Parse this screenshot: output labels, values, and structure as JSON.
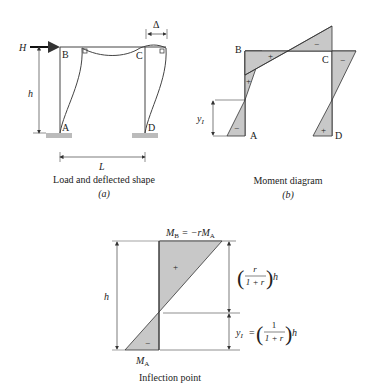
{
  "colors": {
    "fill": "#c8c8c8",
    "line": "#333333",
    "text": "#222222"
  },
  "panel_a": {
    "load": "H",
    "height_label": "h",
    "span_label": "L",
    "drift_label": "Δ",
    "joints": {
      "A": "A",
      "B": "B",
      "C": "C",
      "D": "D"
    },
    "caption": "Load and deflected shape",
    "sublabel": "(a)"
  },
  "panel_b": {
    "joints": {
      "A": "A",
      "B": "B",
      "C": "C",
      "D": "D"
    },
    "signs": {
      "col_ab_top": "+",
      "col_ab_bottom": "−",
      "beam_left": "+",
      "beam_right": "−",
      "col_cd_top": "−",
      "col_cd_bottom": "+"
    },
    "yi_label": "y",
    "yi_sub": "I",
    "caption": "Moment diagram",
    "sublabel": "(b)"
  },
  "panel_c": {
    "mb_eq": "M",
    "mb_sub": "B",
    "mb_rhs": " = −rM",
    "mb_rhs_sub": "A",
    "ma": "M",
    "ma_sub": "A",
    "h_label": "h",
    "plus": "+",
    "minus": "−",
    "upper_num": "r",
    "upper_den": "1 + r",
    "upper_h": "h",
    "lower_lhs": "y",
    "lower_lhs_sub": "I",
    "lower_eq": "=",
    "lower_num": "1",
    "lower_den": "1 + r",
    "lower_h": "h",
    "caption": "Inflection point"
  }
}
